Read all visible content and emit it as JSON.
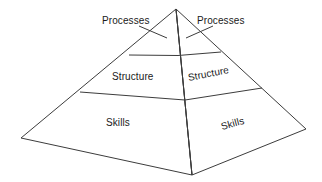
{
  "diagram": {
    "type": "3d-pyramid",
    "stroke_color": "#3c3c3c",
    "background_color": "#ffffff",
    "fill_color": "none",
    "tiers": [
      {
        "name": "processes",
        "label": "Processes",
        "level": 3,
        "position": "apex"
      },
      {
        "name": "structure",
        "label": "Structure",
        "level": 2,
        "position": "middle"
      },
      {
        "name": "skills",
        "label": "Skills",
        "level": 1,
        "position": "base"
      }
    ],
    "labels": {
      "processes_left": "Processes",
      "processes_right": "Processes",
      "structure_left": "Structure",
      "structure_right": "Structure",
      "skills_left": "Skills",
      "skills_right": "Skills"
    },
    "geometry": {
      "apex": [
        176,
        9
      ],
      "front_vertex": [
        192,
        175
      ],
      "left_vertex": [
        21,
        138
      ],
      "right_vertex": [
        306,
        129
      ],
      "left_face_divider_upper": [
        [
          129,
          55
        ],
        [
          178,
          55
        ]
      ],
      "left_face_divider_lower": [
        [
          80,
          92
        ],
        [
          185,
          100
        ]
      ],
      "right_face_divider_upper": [
        [
          178,
          55
        ],
        [
          221,
          52
        ]
      ],
      "right_face_divider_lower": [
        [
          185,
          100
        ],
        [
          262,
          88
        ]
      ]
    },
    "leader_lines": [
      {
        "name": "processes-left-leader",
        "from": [
          140,
          27
        ],
        "to": [
          166,
          37
        ]
      },
      {
        "name": "processes-right-leader",
        "from": [
          212,
          27
        ],
        "to": [
          186,
          37
        ]
      }
    ]
  }
}
